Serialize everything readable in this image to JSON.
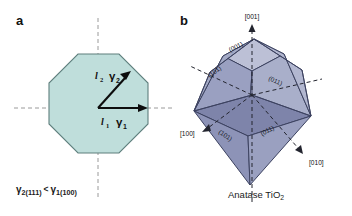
{
  "figure": {
    "background_color": "#ffffff",
    "width": 352,
    "height": 216
  },
  "panel_a": {
    "letter": "a",
    "shape": "octagon",
    "fill_color": "#bfdedb",
    "stroke_color": "#5a7a78",
    "axis_color": "#8d8d8d",
    "arrow_color": "#111111",
    "vectors": [
      {
        "name": "gamma-1-horizontal",
        "length_label": "l",
        "length_sub": "1",
        "gamma_label": "γ",
        "gamma_sub": "1",
        "direction": "horizontal-right"
      },
      {
        "name": "gamma-2-diagonal",
        "length_label": "l",
        "length_sub": "2",
        "gamma_label": "γ",
        "gamma_sub": "2",
        "direction": "diagonal-upper-right"
      }
    ],
    "caption": {
      "gamma_left": "γ",
      "gamma_left_sub": "2(111)",
      "relation": "<",
      "gamma_right": "γ",
      "gamma_right_sub": "1(100)",
      "full_text": "γ2(111) < γ1(100)"
    }
  },
  "panel_b": {
    "letter": "b",
    "caption": "Anatase TiO2",
    "caption_main": "Anatase TiO",
    "caption_sub": "2",
    "crystal": {
      "name": "anatase-bipyramid",
      "face_colors": {
        "top_light": "#b9bdd4",
        "upper_left": "#9ea4c2",
        "upper_right": "#aab0cb",
        "mid_dark": "#7f85ab",
        "lower_left": "#8d93b7",
        "lower_right": "#9aa0c0",
        "bottom_shade": "#868cb2"
      },
      "stroke_color": "#3c4260"
    },
    "facet_labels": [
      {
        "name": "facet-001-top",
        "text": "(001)"
      },
      {
        "name": "facet-101-upper-left",
        "text": "(101)"
      },
      {
        "name": "facet-011-upper-right",
        "text": "(011)"
      },
      {
        "name": "facet-101-lower-left",
        "text": "(101)"
      },
      {
        "name": "facet-011-lower-right",
        "text": "(011)"
      }
    ],
    "direction_labels": [
      {
        "name": "direction-001",
        "text": "[001]"
      },
      {
        "name": "direction-100",
        "text": "[100]"
      },
      {
        "name": "direction-010",
        "text": "[010]"
      }
    ]
  }
}
